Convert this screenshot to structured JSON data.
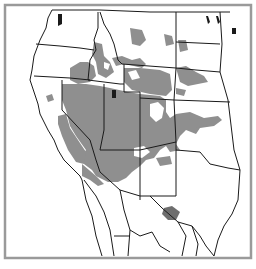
{
  "map": {
    "type": "choropleth-shading",
    "region": "Western United States and northern Mexico",
    "frame_color": "#9a9a9a",
    "shaded_color": "#8f8f8f",
    "highlight_color": "#6e6e6e",
    "border_color": "#1a1a1a",
    "background_color": "#ffffff",
    "legend": null,
    "labels": []
  }
}
